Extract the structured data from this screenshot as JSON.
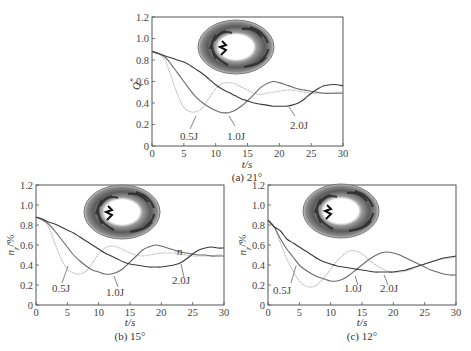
{
  "chart_data": [
    {
      "type": "line",
      "panel": "a",
      "caption": "(a) 21°",
      "xlabel": "t/s",
      "ylabel": "Q*",
      "xlim": [
        0,
        30
      ],
      "ylim": [
        0,
        1.2
      ],
      "xticks": [
        0,
        5,
        10,
        15,
        20,
        25,
        30
      ],
      "yticks": [
        0,
        0.2,
        0.4,
        0.6,
        0.8,
        1.0,
        1.2
      ],
      "grid": false,
      "annotations": [
        "0.5J",
        "1.0J",
        "2.0J"
      ],
      "series": [
        {
          "name": "0.5J",
          "color": "#b8b8b8",
          "x": [
            0,
            1,
            2,
            3,
            4,
            5,
            6,
            7,
            8,
            9,
            10,
            11,
            12,
            13,
            14,
            15,
            16,
            17,
            18,
            19,
            20,
            21,
            22,
            23,
            24,
            25,
            26,
            27,
            28,
            29,
            30
          ],
          "y": [
            0.88,
            0.86,
            0.8,
            0.65,
            0.48,
            0.36,
            0.32,
            0.32,
            0.36,
            0.45,
            0.53,
            0.58,
            0.59,
            0.58,
            0.55,
            0.52,
            0.49,
            0.48,
            0.49,
            0.5,
            0.51,
            0.52,
            0.52,
            0.51,
            0.5,
            0.49,
            0.49,
            0.49,
            0.49,
            0.5,
            0.5
          ]
        },
        {
          "name": "1.0J",
          "color": "#6a6a6a",
          "x": [
            0,
            1,
            2,
            3,
            4,
            5,
            6,
            7,
            8,
            9,
            10,
            11,
            12,
            13,
            14,
            15,
            16,
            17,
            18,
            19,
            20,
            21,
            22,
            23,
            24,
            25,
            26,
            27,
            28,
            29,
            30
          ],
          "y": [
            0.88,
            0.86,
            0.83,
            0.76,
            0.68,
            0.6,
            0.52,
            0.45,
            0.4,
            0.36,
            0.33,
            0.31,
            0.31,
            0.33,
            0.37,
            0.42,
            0.48,
            0.54,
            0.58,
            0.6,
            0.59,
            0.57,
            0.55,
            0.53,
            0.52,
            0.51,
            0.5,
            0.49,
            0.49,
            0.49,
            0.49
          ]
        },
        {
          "name": "2.0J",
          "color": "#3a3a3a",
          "x": [
            0,
            1,
            2,
            3,
            4,
            5,
            6,
            7,
            8,
            9,
            10,
            11,
            12,
            13,
            14,
            15,
            16,
            17,
            18,
            19,
            20,
            21,
            22,
            23,
            24,
            25,
            26,
            27,
            28,
            29,
            30
          ],
          "y": [
            0.88,
            0.86,
            0.84,
            0.82,
            0.8,
            0.78,
            0.75,
            0.71,
            0.67,
            0.62,
            0.57,
            0.53,
            0.5,
            0.47,
            0.44,
            0.42,
            0.4,
            0.39,
            0.38,
            0.37,
            0.37,
            0.37,
            0.38,
            0.4,
            0.44,
            0.49,
            0.53,
            0.56,
            0.57,
            0.57,
            0.56
          ]
        }
      ]
    },
    {
      "type": "line",
      "panel": "b",
      "caption": "(b) 15°",
      "xlabel": "t/s",
      "ylabel": "n_r/%",
      "xlim": [
        0,
        30
      ],
      "ylim": [
        0,
        1.2
      ],
      "xticks": [
        0,
        5,
        10,
        15,
        20,
        25,
        30
      ],
      "yticks": [
        0,
        0.2,
        0.4,
        0.6,
        0.8,
        1.0,
        1.2
      ],
      "grid": false,
      "annotations": [
        "0.5J",
        "1.0J",
        "2.0J",
        "n"
      ],
      "series": [
        {
          "name": "0.5J",
          "color": "#b8b8b8",
          "x": [
            0,
            1,
            2,
            3,
            4,
            5,
            6,
            7,
            8,
            9,
            10,
            11,
            12,
            13,
            14,
            15,
            16,
            17,
            18,
            19,
            20,
            21,
            22,
            23,
            24,
            25,
            26,
            27,
            28,
            29,
            30
          ],
          "y": [
            0.88,
            0.86,
            0.78,
            0.62,
            0.46,
            0.36,
            0.32,
            0.31,
            0.34,
            0.42,
            0.51,
            0.57,
            0.59,
            0.58,
            0.55,
            0.52,
            0.5,
            0.49,
            0.5,
            0.51,
            0.52,
            0.52,
            0.52,
            0.51,
            0.5,
            0.49,
            0.49,
            0.49,
            0.49,
            0.5,
            0.5
          ]
        },
        {
          "name": "1.0J",
          "color": "#6a6a6a",
          "x": [
            0,
            1,
            2,
            3,
            4,
            5,
            6,
            7,
            8,
            9,
            10,
            11,
            12,
            13,
            14,
            15,
            16,
            17,
            18,
            19,
            20,
            21,
            22,
            23,
            24,
            25,
            26,
            27,
            28,
            29,
            30
          ],
          "y": [
            0.88,
            0.85,
            0.81,
            0.74,
            0.66,
            0.58,
            0.5,
            0.44,
            0.39,
            0.35,
            0.33,
            0.31,
            0.31,
            0.33,
            0.37,
            0.43,
            0.49,
            0.55,
            0.58,
            0.6,
            0.59,
            0.57,
            0.55,
            0.53,
            0.52,
            0.51,
            0.5,
            0.5,
            0.49,
            0.49,
            0.49
          ]
        },
        {
          "name": "2.0J",
          "color": "#3a3a3a",
          "x": [
            0,
            1,
            2,
            3,
            4,
            5,
            6,
            7,
            8,
            9,
            10,
            11,
            12,
            13,
            14,
            15,
            16,
            17,
            18,
            19,
            20,
            21,
            22,
            23,
            24,
            25,
            26,
            27,
            28,
            29,
            30
          ],
          "y": [
            0.88,
            0.86,
            0.83,
            0.81,
            0.78,
            0.75,
            0.72,
            0.68,
            0.64,
            0.6,
            0.56,
            0.52,
            0.49,
            0.46,
            0.43,
            0.41,
            0.4,
            0.39,
            0.38,
            0.38,
            0.38,
            0.39,
            0.4,
            0.42,
            0.46,
            0.51,
            0.55,
            0.57,
            0.58,
            0.57,
            0.57
          ]
        }
      ]
    },
    {
      "type": "line",
      "panel": "c",
      "caption": "(c) 12°",
      "xlabel": "t/s",
      "ylabel": "n_r/%",
      "xlim": [
        0,
        30
      ],
      "ylim": [
        0,
        1.2
      ],
      "xticks": [
        0,
        5,
        10,
        15,
        20,
        25,
        30
      ],
      "yticks": [
        0,
        0.2,
        0.4,
        0.6,
        0.8,
        1.0,
        1.2
      ],
      "grid": false,
      "annotations": [
        "0.5J",
        "1.0J",
        "2.0J"
      ],
      "series": [
        {
          "name": "0.5J",
          "color": "#b8b8b8",
          "x": [
            0,
            1,
            2,
            3,
            4,
            5,
            6,
            7,
            8,
            9,
            10,
            11,
            12,
            13,
            14,
            15,
            16,
            17,
            18,
            19,
            20,
            21,
            22,
            23,
            24,
            25,
            26,
            27,
            28,
            29,
            30
          ],
          "y": [
            0.85,
            0.78,
            0.62,
            0.46,
            0.34,
            0.24,
            0.19,
            0.18,
            0.21,
            0.28,
            0.36,
            0.44,
            0.5,
            0.54,
            0.54,
            0.51,
            0.46,
            0.41,
            0.37,
            0.34,
            0.33,
            0.33,
            0.34,
            0.36,
            0.39,
            0.41,
            0.43,
            0.45,
            0.46,
            0.47,
            0.48
          ]
        },
        {
          "name": "1.0J",
          "color": "#6a6a6a",
          "x": [
            0,
            1,
            2,
            3,
            4,
            5,
            6,
            7,
            8,
            9,
            10,
            11,
            12,
            13,
            14,
            15,
            16,
            17,
            18,
            19,
            20,
            21,
            22,
            23,
            24,
            25,
            26,
            27,
            28,
            29,
            30
          ],
          "y": [
            0.85,
            0.78,
            0.66,
            0.56,
            0.48,
            0.4,
            0.35,
            0.31,
            0.28,
            0.26,
            0.24,
            0.24,
            0.26,
            0.3,
            0.35,
            0.4,
            0.45,
            0.49,
            0.52,
            0.53,
            0.52,
            0.5,
            0.47,
            0.44,
            0.41,
            0.38,
            0.35,
            0.33,
            0.31,
            0.3,
            0.3
          ]
        },
        {
          "name": "2.0J",
          "color": "#3a3a3a",
          "x": [
            0,
            1,
            2,
            3,
            4,
            5,
            6,
            7,
            8,
            9,
            10,
            11,
            12,
            13,
            14,
            15,
            16,
            17,
            18,
            19,
            20,
            21,
            22,
            23,
            24,
            25,
            26,
            27,
            28,
            29,
            30
          ],
          "y": [
            0.85,
            0.78,
            0.74,
            0.66,
            0.62,
            0.58,
            0.54,
            0.5,
            0.46,
            0.43,
            0.41,
            0.39,
            0.38,
            0.37,
            0.36,
            0.35,
            0.34,
            0.33,
            0.33,
            0.33,
            0.33,
            0.34,
            0.35,
            0.37,
            0.39,
            0.41,
            0.43,
            0.45,
            0.47,
            0.48,
            0.49
          ]
        }
      ]
    }
  ],
  "panels": {
    "a": {
      "caption": "(a) 21°",
      "xlabel": "t/s",
      "ylabel_main": "Q",
      "ylabel_sup": "*",
      "annot": {
        "half": "0.5J",
        "one": "1.0J",
        "two": "2.0J"
      }
    },
    "b": {
      "caption": "(b) 15°",
      "xlabel": "t/s",
      "ylabel_main": "n",
      "ylabel_sub": "r",
      "ylabel_unit": "/%",
      "annot": {
        "half": "0.5J",
        "one": "1.0J",
        "two": "2.0J",
        "n": "n"
      }
    },
    "c": {
      "caption": "(c) 12°",
      "xlabel": "t/s",
      "ylabel_main": "n",
      "ylabel_sub": "r",
      "ylabel_unit": "/%",
      "annot": {
        "half": "0.5J",
        "one": "1.0J",
        "two": "2.0J"
      }
    }
  },
  "ticks": {
    "x": [
      "0",
      "5",
      "10",
      "15",
      "20",
      "25",
      "30"
    ],
    "y": [
      "0",
      "0.2",
      "0.4",
      "0.6",
      "0.8",
      "1.0",
      "1.2"
    ]
  },
  "colors": {
    "axis": "#555555",
    "series_half": "#b8b8b8",
    "series_one": "#6a6a6a",
    "series_two": "#3a3a3a"
  }
}
